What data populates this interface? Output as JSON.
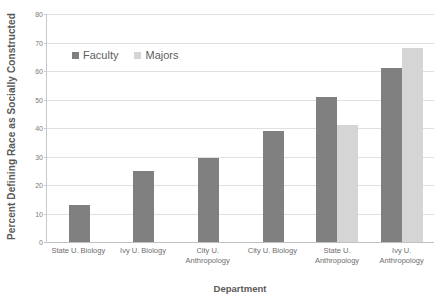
{
  "chart_data": {
    "type": "bar",
    "title": "",
    "xlabel": "Department",
    "ylabel": "Percent Defining Race as Socially Constructed",
    "categories": [
      "State U. Biology",
      "Ivy U. Biology",
      "City U. Anthropology",
      "City U. Biology",
      "State U. Anthropology",
      "Ivy U. Anthropology"
    ],
    "category_lines": [
      [
        "State U. Biology"
      ],
      [
        "Ivy U. Biology"
      ],
      [
        "City U.",
        "Anthropology"
      ],
      [
        "City U. Biology"
      ],
      [
        "State U.",
        "Anthropology"
      ],
      [
        "Ivy U.",
        "Anthropology"
      ]
    ],
    "series": [
      {
        "name": "Faculty",
        "color": "#808080",
        "values": [
          13,
          25,
          29.5,
          39,
          51,
          61
        ]
      },
      {
        "name": "Majors",
        "color": "#d5d5d5",
        "values": [
          null,
          null,
          null,
          null,
          41,
          68
        ]
      }
    ],
    "ylim": [
      0,
      80
    ],
    "yticks": [
      0,
      10,
      20,
      30,
      40,
      50,
      60,
      70,
      80
    ],
    "ytick_labels": [
      "0",
      "10",
      "20",
      "30",
      "40",
      "50",
      "60",
      "70",
      "80"
    ],
    "grid": true,
    "legend_position": "upper-left-inside",
    "legend_entries": [
      "Faculty",
      "Majors"
    ]
  }
}
